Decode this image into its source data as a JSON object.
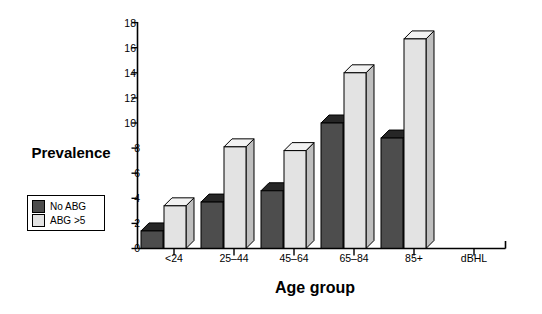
{
  "chart_data": {
    "type": "bar",
    "title": "",
    "xlabel": "Age group",
    "ylabel": "Prevalence\n(%)",
    "ylabel_line1": "Prevalence",
    "ylabel_line2": "(%)",
    "categories": [
      "<24",
      "25–44",
      "45–64",
      "65–84",
      "85+",
      "dBHL"
    ],
    "series": [
      {
        "name": "No ABG",
        "color": "#4d4d4d",
        "values": [
          1.4,
          3.7,
          4.6,
          10.0,
          8.8,
          null
        ]
      },
      {
        "name": "ABG >5",
        "color": "#e3e3e3",
        "values": [
          3.4,
          8.1,
          7.8,
          14.0,
          16.7,
          null
        ]
      }
    ],
    "ylim": [
      0,
      18
    ],
    "ytick_step": 2,
    "yticks": [
      "0",
      "2",
      "4",
      "6",
      "8",
      "10",
      "12",
      "14",
      "16",
      "18"
    ],
    "grid": false,
    "legend_position": "left-lower",
    "style": "3d-bars"
  },
  "legend": {
    "items": [
      {
        "label": "No ABG",
        "color": "#4d4d4d"
      },
      {
        "label": "ABG >5",
        "color": "#e3e3e3"
      }
    ]
  },
  "colors": {
    "bar_dark_front": "#4d4d4d",
    "bar_dark_top": "#262626",
    "bar_dark_side": "#3a3a3a",
    "bar_light_front": "#e3e3e3",
    "bar_light_top": "#f2f2f2",
    "bar_light_side": "#bfbfbf",
    "axis": "#000000",
    "background": "#ffffff"
  }
}
